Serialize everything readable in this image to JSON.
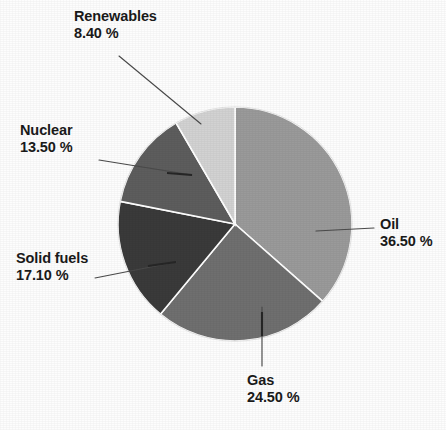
{
  "chart_data": {
    "type": "pie",
    "title": "",
    "subtitle": "",
    "xlabel": "",
    "ylabel": "",
    "legend_position": "none",
    "grid": false,
    "label_format": "name on first line, percent on second line",
    "start_angle_deg": 0,
    "direction": "clockwise",
    "categories": [
      "Oil",
      "Gas",
      "Solid fuels",
      "Nuclear",
      "Renewables"
    ],
    "values": [
      36.5,
      24.5,
      17.1,
      13.5,
      8.4
    ],
    "slices": [
      {
        "name": "Oil",
        "value": 36.5,
        "percent_text": "36.50 %",
        "color": "#9a9a9a",
        "label_line1": "Oil",
        "label_line2": "36.50 %"
      },
      {
        "name": "Gas",
        "value": 24.5,
        "percent_text": "24.50 %",
        "color": "#6f6f6f",
        "label_line1": "Gas",
        "label_line2": "24.50 %"
      },
      {
        "name": "Solid fuels",
        "value": 17.1,
        "percent_text": "17.10 %",
        "color": "#3a3a3a",
        "label_line1": "Solid fuels",
        "label_line2": "17.10 %"
      },
      {
        "name": "Nuclear",
        "value": 13.5,
        "percent_text": "13.50 %",
        "color": "#5d5d5d",
        "label_line1": "Nuclear",
        "label_line2": "13.50 %"
      },
      {
        "name": "Renewables",
        "value": 8.4,
        "percent_text": "8.40 %",
        "color": "#d2d2d2",
        "label_line1": "Renewables",
        "label_line2": "8.40 %"
      }
    ],
    "total": 100.0,
    "units": "percent",
    "colors": {
      "oil": "#9a9a9a",
      "gas": "#6f6f6f",
      "solid_fuels": "#3a3a3a",
      "nuclear": "#5d5d5d",
      "renewables": "#d2d2d2",
      "slice_separator": "#ffffff",
      "leader_line": "#4a4a4a",
      "label_text": "#1a1a1a",
      "background": "#fdfdfd"
    }
  }
}
